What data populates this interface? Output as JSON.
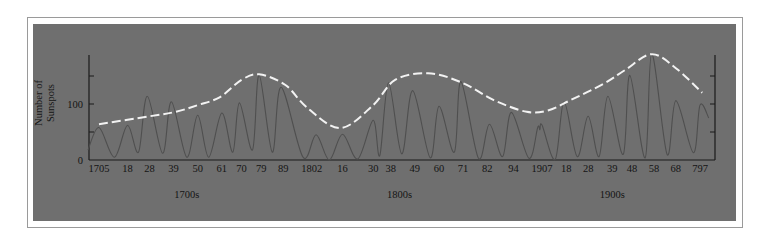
{
  "chart_data": {
    "type": "line",
    "title": "",
    "xlabel": "",
    "ylabel": "Number of Sunspots",
    "ylabel_lines": [
      "Number of",
      "Sunspots"
    ],
    "ylim": [
      0,
      190
    ],
    "xlim": [
      1700,
      1985
    ],
    "grid": false,
    "legend": null,
    "y_ticks": [
      {
        "value": 0,
        "label": "0"
      },
      {
        "value": 50,
        "label": ""
      },
      {
        "value": 100,
        "label": "100"
      },
      {
        "value": 150,
        "label": ""
      }
    ],
    "x_ticks": [
      {
        "year": 1705,
        "label": "1705"
      },
      {
        "year": 1718,
        "label": "18"
      },
      {
        "year": 1728,
        "label": "28"
      },
      {
        "year": 1739,
        "label": "39"
      },
      {
        "year": 1750,
        "label": "50"
      },
      {
        "year": 1761,
        "label": "61"
      },
      {
        "year": 1770,
        "label": "70"
      },
      {
        "year": 1779,
        "label": "79"
      },
      {
        "year": 1789,
        "label": "89"
      },
      {
        "year": 1802,
        "label": "1802"
      },
      {
        "year": 1816,
        "label": "16"
      },
      {
        "year": 1830,
        "label": "30"
      },
      {
        "year": 1838,
        "label": "38"
      },
      {
        "year": 1849,
        "label": "49"
      },
      {
        "year": 1860,
        "label": "60"
      },
      {
        "year": 1871,
        "label": "71"
      },
      {
        "year": 1882,
        "label": "82"
      },
      {
        "year": 1894,
        "label": "94"
      },
      {
        "year": 1907,
        "label": "1907"
      },
      {
        "year": 1918,
        "label": "18"
      },
      {
        "year": 1928,
        "label": "28"
      },
      {
        "year": 1939,
        "label": "39"
      },
      {
        "year": 1948,
        "label": "48"
      },
      {
        "year": 1958,
        "label": "58"
      },
      {
        "year": 1968,
        "label": "68"
      },
      {
        "year": 1979,
        "label": "797"
      }
    ],
    "century_labels": [
      {
        "year": 1745,
        "label": "1700s"
      },
      {
        "year": 1842,
        "label": "1800s"
      },
      {
        "year": 1939,
        "label": "1900s"
      }
    ],
    "series": [
      {
        "name": "Annual sunspot number",
        "style": "solid",
        "color": "#4f4f4f",
        "x": [
          1700,
          1705,
          1712,
          1718,
          1723,
          1727,
          1734,
          1738,
          1745,
          1750,
          1755,
          1761,
          1766,
          1769,
          1775,
          1778,
          1784,
          1788,
          1798,
          1804,
          1810,
          1816,
          1823,
          1830,
          1833,
          1837,
          1843,
          1848,
          1856,
          1860,
          1867,
          1870,
          1878,
          1883,
          1889,
          1893,
          1901,
          1905,
          1906,
          1907,
          1913,
          1917,
          1923,
          1928,
          1933,
          1937,
          1944,
          1947,
          1954,
          1957,
          1964,
          1968,
          1976,
          1979,
          1983
        ],
        "values": [
          18,
          58,
          5,
          62,
          14,
          114,
          12,
          104,
          5,
          80,
          5,
          84,
          14,
          102,
          18,
          152,
          14,
          130,
          5,
          45,
          0,
          46,
          2,
          71,
          8,
          138,
          11,
          124,
          4,
          96,
          14,
          140,
          3,
          64,
          6,
          85,
          3,
          58,
          54,
          62,
          1,
          104,
          6,
          78,
          6,
          114,
          10,
          151,
          4,
          190,
          10,
          106,
          13,
          98,
          75
        ]
      },
      {
        "name": "Smoothed trend",
        "style": "dashed",
        "color": "#f2f2f2",
        "x": [
          1705,
          1728,
          1740,
          1750,
          1760,
          1770,
          1778,
          1790,
          1800,
          1815,
          1830,
          1840,
          1855,
          1870,
          1885,
          1900,
          1910,
          1920,
          1935,
          1945,
          1957,
          1968,
          1980
        ],
        "values": [
          64,
          78,
          86,
          98,
          112,
          143,
          153,
          134,
          93,
          57,
          98,
          143,
          155,
          139,
          107,
          86,
          89,
          107,
          136,
          161,
          189,
          164,
          120
        ]
      }
    ]
  },
  "colors": {
    "page_background": "#ffffff",
    "frame_border": "#9a9a9a",
    "panel_background": "#6f6f6f",
    "axis": "#1a1a1a",
    "data_line": "#4f4f4f",
    "trend_line": "#f2f2f2"
  }
}
